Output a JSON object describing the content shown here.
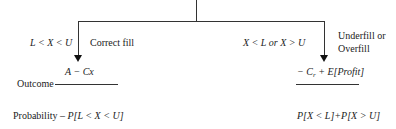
{
  "diagram": {
    "type": "decision-tree",
    "branches": [
      {
        "id": "correct",
        "condition": "L < X < U",
        "label": "Correct fill",
        "outcome": "A − Cx",
        "probability": "P[L < X < U]"
      },
      {
        "id": "incorrect",
        "condition": "X < L  or  X > U",
        "label_line1": "Underfill or",
        "label_line2": "Overfill",
        "outcome_prefix": "− C",
        "outcome_sub": "r",
        "outcome_suffix": " + E[Profit]",
        "probability": "P[X < L]+P[X > U]"
      }
    ],
    "row_labels": {
      "outcome": "Outcome",
      "probability_prefix": "Probability – "
    },
    "colors": {
      "line": "#333333",
      "text": "#222222",
      "background": "#ffffff"
    }
  }
}
